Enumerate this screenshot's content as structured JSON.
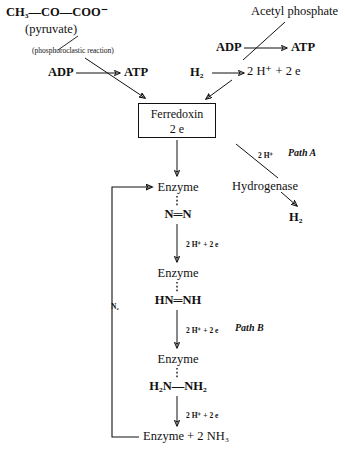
{
  "nodes": {
    "pyruvate_formula": "CH₃—CO—COO⁻",
    "pyruvate_name": "(pyruvate)",
    "phosphoroclastic": "(phosphoroclastic reaction)",
    "adp_left": "ADP",
    "atp_left": "ATP",
    "acetyl_phosphate": "Acetyl phosphate",
    "adp_right": "ADP",
    "atp_right": "ATP",
    "h2_source": "H₂",
    "protons_electrons": "2 H⁺ + 2 e",
    "ferredoxin_line1": "Ferredoxin",
    "ferredoxin_line2": "2 e",
    "path_a_label": "Path A",
    "path_a_protons": "2 H⁺",
    "hydrogenase": "Hydrogenase",
    "h2_product": "H₂",
    "path_b_label": "Path B",
    "enzyme_1": "Enzyme",
    "substrate_1": "N═N",
    "enzyme_2": "Enzyme",
    "substrate_2": "HN═NH",
    "enzyme_3": "Enzyme",
    "substrate_3": "H₂N—NH₂",
    "product_final": "Enzyme + 2 NH₃",
    "n2_recycle": "N₂",
    "reduction_step_1": "2 H⁺ + 2 e",
    "reduction_step_2": "2 H⁺ + 2 e",
    "reduction_step_3": "2 H⁺ + 2 e"
  },
  "colors": {
    "ink": "#111111",
    "paper": "#ffffff"
  }
}
